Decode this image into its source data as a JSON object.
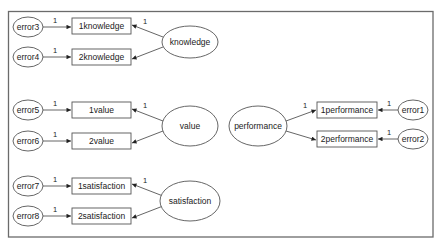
{
  "diagram": {
    "type": "structural-equation-model",
    "latent_factors": [
      {
        "id": "knowledge",
        "label": "knowledge"
      },
      {
        "id": "value",
        "label": "value"
      },
      {
        "id": "satisfaction",
        "label": "satisfaction"
      },
      {
        "id": "performance",
        "label": "performance"
      }
    ],
    "observed": [
      {
        "id": "1knowledge",
        "label": "1knowledge"
      },
      {
        "id": "2knowledge",
        "label": "2knowledge"
      },
      {
        "id": "1value",
        "label": "1value"
      },
      {
        "id": "2value",
        "label": "2value"
      },
      {
        "id": "1satisfaction",
        "label": "1satisfaction"
      },
      {
        "id": "2satisfaction",
        "label": "2satisfaction"
      },
      {
        "id": "1performance",
        "label": "1performance"
      },
      {
        "id": "2performance",
        "label": "2performance"
      }
    ],
    "errors": [
      {
        "id": "error1",
        "label": "error1"
      },
      {
        "id": "error2",
        "label": "error2"
      },
      {
        "id": "error3",
        "label": "error3"
      },
      {
        "id": "error4",
        "label": "error4"
      },
      {
        "id": "error5",
        "label": "error5"
      },
      {
        "id": "error6",
        "label": "error6"
      },
      {
        "id": "error7",
        "label": "error7"
      },
      {
        "id": "error8",
        "label": "error8"
      }
    ],
    "edges": [
      {
        "from": "error3",
        "to": "1knowledge",
        "weight": "1"
      },
      {
        "from": "error4",
        "to": "2knowledge",
        "weight": "1"
      },
      {
        "from": "knowledge",
        "to": "1knowledge",
        "weight": "1"
      },
      {
        "from": "knowledge",
        "to": "2knowledge",
        "weight": ""
      },
      {
        "from": "error5",
        "to": "1value",
        "weight": "1"
      },
      {
        "from": "error6",
        "to": "2value",
        "weight": "1"
      },
      {
        "from": "value",
        "to": "1value",
        "weight": "1"
      },
      {
        "from": "value",
        "to": "2value",
        "weight": ""
      },
      {
        "from": "error7",
        "to": "1satisfaction",
        "weight": "1"
      },
      {
        "from": "error8",
        "to": "2satisfaction",
        "weight": "1"
      },
      {
        "from": "satisfaction",
        "to": "1satisfaction",
        "weight": "1"
      },
      {
        "from": "satisfaction",
        "to": "2satisfaction",
        "weight": ""
      },
      {
        "from": "performance",
        "to": "1performance",
        "weight": "1"
      },
      {
        "from": "performance",
        "to": "2performance",
        "weight": ""
      },
      {
        "from": "error1",
        "to": "1performance",
        "weight": "1"
      },
      {
        "from": "error2",
        "to": "2performance",
        "weight": "1"
      }
    ]
  },
  "labels": {
    "error1": "error1",
    "error2": "error2",
    "error3": "error3",
    "error4": "error4",
    "error5": "error5",
    "error6": "error6",
    "error7": "error7",
    "error8": "error8",
    "k1": "1knowledge",
    "k2": "2knowledge",
    "knowledge": "knowledge",
    "v1": "1value",
    "v2": "2value",
    "value": "value",
    "s1": "1satisfaction",
    "s2": "2satisfaction",
    "satisfaction": "satisfaction",
    "p1": "1performance",
    "p2": "2performance",
    "performance": "performance",
    "one": "1"
  }
}
